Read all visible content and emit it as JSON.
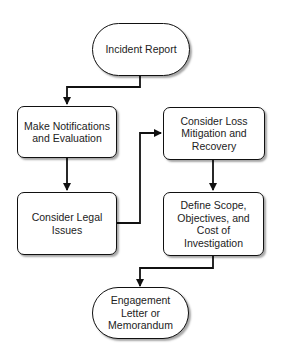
{
  "diagram": {
    "type": "flowchart",
    "nodes": {
      "n1": {
        "label": "Incident Report",
        "shape": "terminal"
      },
      "n2": {
        "label": "Make Notifications\nand Evaluation",
        "shape": "process"
      },
      "n3": {
        "label": "Consider Legal\nIssues",
        "shape": "process"
      },
      "n4": {
        "label": "Consider Loss\nMitigation and\nRecovery",
        "shape": "process"
      },
      "n5": {
        "label": "Define Scope,\nObjectives, and\nCost of\nInvestigation",
        "shape": "process"
      },
      "n6": {
        "label": "Engagement\nLetter or\nMemorandum",
        "shape": "terminal"
      }
    },
    "edges": [
      {
        "from": "n1",
        "to": "n2"
      },
      {
        "from": "n2",
        "to": "n3"
      },
      {
        "from": "n3",
        "to": "n4"
      },
      {
        "from": "n4",
        "to": "n5"
      },
      {
        "from": "n5",
        "to": "n6"
      }
    ],
    "colors": {
      "stroke": "#111111",
      "fill": "#ffffff",
      "text": "#222222"
    }
  }
}
